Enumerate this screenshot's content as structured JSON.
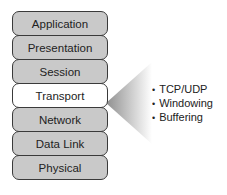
{
  "diagram": {
    "type": "OSI model layer stack",
    "layers": [
      {
        "label": "Application",
        "highlighted": false
      },
      {
        "label": "Presentation",
        "highlighted": false
      },
      {
        "label": "Session",
        "highlighted": false
      },
      {
        "label": "Transport",
        "highlighted": true
      },
      {
        "label": "Network",
        "highlighted": false
      },
      {
        "label": "Data Link",
        "highlighted": false
      },
      {
        "label": "Physical",
        "highlighted": false
      }
    ],
    "callout": {
      "target_layer": "Transport",
      "items": [
        "TCP/UDP",
        "Windowing",
        "Buffering"
      ]
    },
    "colors": {
      "layer_fill": "#c9c9c9",
      "highlight_fill": "#ffffff",
      "border": "#3a3a3a",
      "cone_gradient": [
        "#9a9a9a",
        "#ffffff"
      ]
    }
  }
}
